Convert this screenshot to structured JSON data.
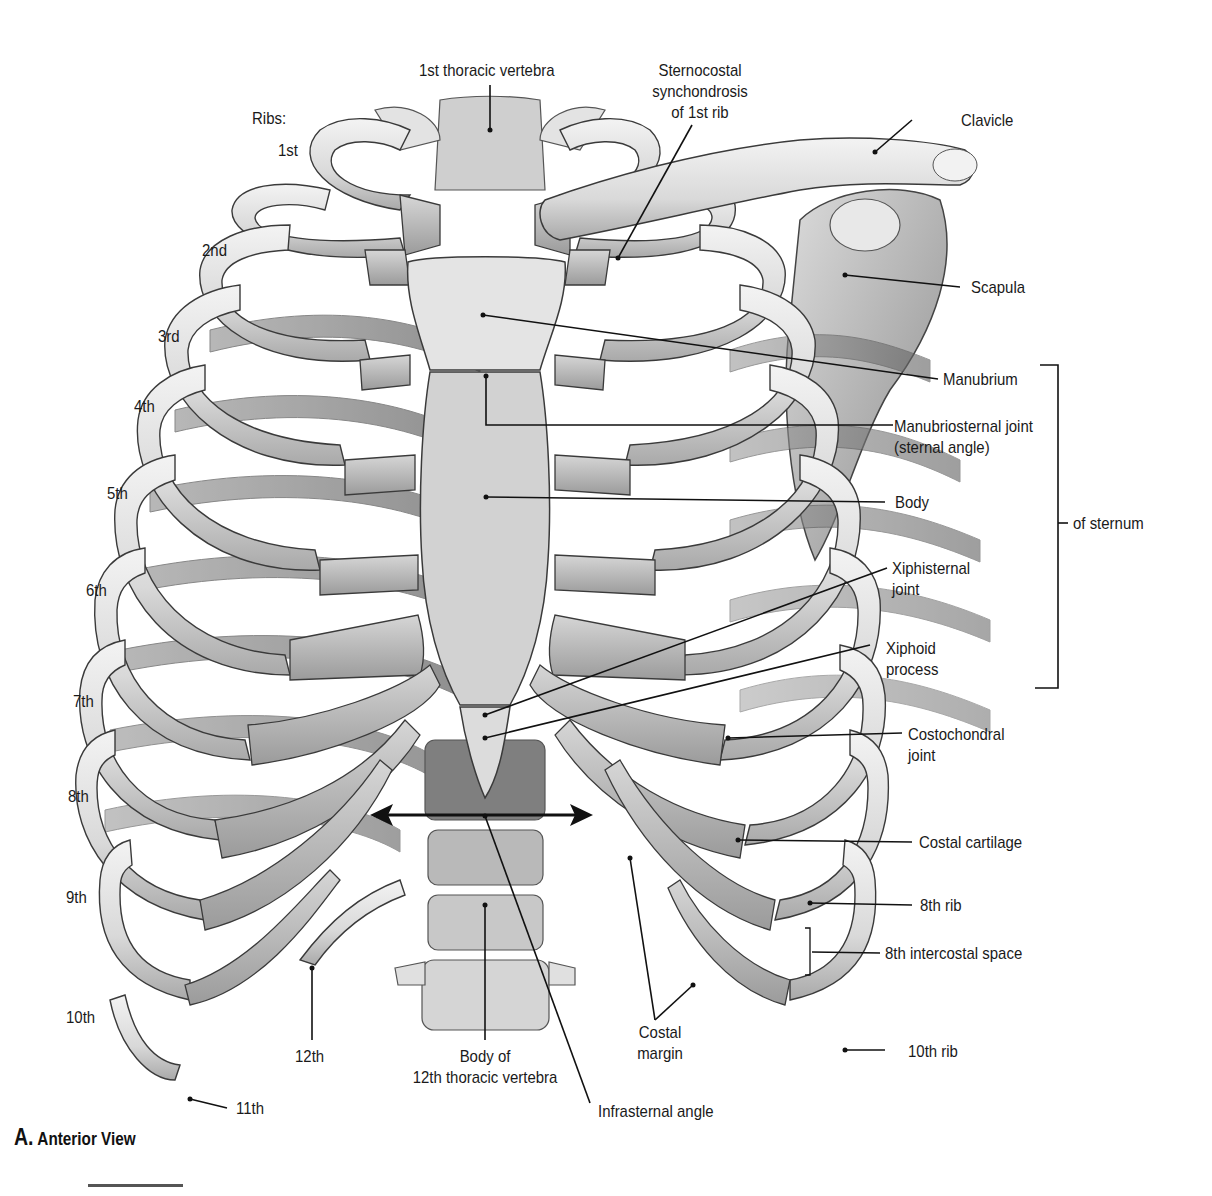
{
  "figure": {
    "caption_letter": "A.",
    "caption_text": "Anterior View",
    "colors": {
      "bone_light": "#ececec",
      "bone_mid": "#c9c9c9",
      "bone_dark": "#8a8a8a",
      "outline": "#3a3a3a",
      "label": "#1a1a1a",
      "background": "#ffffff"
    }
  },
  "labels": {
    "ribs_heading": "Ribs:",
    "rib_1": "1st",
    "rib_2": "2nd",
    "rib_3": "3rd",
    "rib_4": "4th",
    "rib_5": "5th",
    "rib_6": "6th",
    "rib_7": "7th",
    "rib_8": "8th",
    "rib_9": "9th",
    "rib_10": "10th",
    "rib_11": "11th",
    "rib_12": "12th",
    "first_thoracic_vertebra": "1st thoracic vertebra",
    "sternocostal_line1": "Sternocostal",
    "sternocostal_line2": "synchondrosis",
    "sternocostal_line3": "of 1st rib",
    "clavicle": "Clavicle",
    "scapula": "Scapula",
    "manubrium": "Manubrium",
    "manubriosternal_line1": "Manubriosternal joint",
    "manubriosternal_line2": "(sternal angle)",
    "body": "Body",
    "of_sternum": "of sternum",
    "xiphisternal_line1": "Xiphisternal",
    "xiphisternal_line2": "joint",
    "xiphoid_line1": "Xiphoid",
    "xiphoid_line2": "process",
    "costochondral_line1": "Costochondral",
    "costochondral_line2": "joint",
    "costal_cartilage": "Costal cartilage",
    "eighth_rib": "8th rib",
    "eighth_intercostal_space": "8th intercostal space",
    "tenth_rib": "10th rib",
    "costal_margin_line1": "Costal",
    "costal_margin_line2": "margin",
    "body_12th_line1": "Body of",
    "body_12th_line2": "12th thoracic vertebra",
    "infrasternal_angle": "Infrasternal angle"
  }
}
